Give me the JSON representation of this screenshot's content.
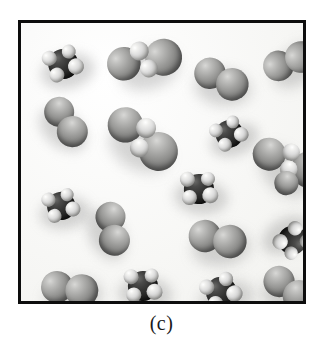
{
  "figure": {
    "caption": "(c)",
    "panel_border_color": "#0d0d0d",
    "panel_background_color": "#fbfbfa",
    "page_background_color": "#ffffff",
    "rendering_style": "space-filling molecular models, grayscale photograph"
  },
  "legend_colors": {
    "large_gray_atom": "#8b8b89",
    "dark_carbon_atom": "#222221",
    "light_hydrogen_atom": "#dedede",
    "shadow": "#78787 6"
  },
  "chart_data": {
    "type": "scatter",
    "title": "(c)",
    "xlabel": "",
    "ylabel": "",
    "xlim": [
      0,
      288
    ],
    "ylim": [
      0,
      284
    ],
    "grid": false,
    "legend": "none",
    "counts": {
      "diatomic_molecules": 7,
      "methane_type_molecules": 6,
      "larger_polyatomic_molecules": 3,
      "total_molecules": 16
    },
    "molecules": [
      {
        "id": 1,
        "kind": "methane",
        "x": 42,
        "y": 40,
        "scale": 1.0,
        "rot": -12
      },
      {
        "id": 2,
        "kind": "poly4",
        "x": 122,
        "y": 38,
        "scale": 1.12,
        "rot": -18
      },
      {
        "id": 3,
        "kind": "diatomic",
        "x": 200,
        "y": 55,
        "scale": 1.05,
        "rot": 8
      },
      {
        "id": 4,
        "kind": "diatomic",
        "x": 268,
        "y": 38,
        "scale": 1.02,
        "rot": -40
      },
      {
        "id": 5,
        "kind": "diatomic",
        "x": 45,
        "y": 98,
        "scale": 1.0,
        "rot": 38
      },
      {
        "id": 6,
        "kind": "poly4",
        "x": 120,
        "y": 115,
        "scale": 1.18,
        "rot": 30
      },
      {
        "id": 7,
        "kind": "methane",
        "x": 208,
        "y": 110,
        "scale": 0.92,
        "rot": -20
      },
      {
        "id": 8,
        "kind": "poly5",
        "x": 268,
        "y": 140,
        "scale": 1.1,
        "rot": 48
      },
      {
        "id": 9,
        "kind": "methane",
        "x": 178,
        "y": 165,
        "scale": 1.0,
        "rot": 6
      },
      {
        "id": 10,
        "kind": "methane",
        "x": 40,
        "y": 182,
        "scale": 0.94,
        "rot": -8
      },
      {
        "id": 11,
        "kind": "diatomic",
        "x": 92,
        "y": 205,
        "scale": 1.0,
        "rot": 62
      },
      {
        "id": 12,
        "kind": "diatomic",
        "x": 196,
        "y": 215,
        "scale": 1.08,
        "rot": -6
      },
      {
        "id": 13,
        "kind": "methane",
        "x": 272,
        "y": 218,
        "scale": 0.96,
        "rot": 150
      },
      {
        "id": 14,
        "kind": "diatomic",
        "x": 48,
        "y": 265,
        "scale": 1.06,
        "rot": -10
      },
      {
        "id": 15,
        "kind": "methane",
        "x": 122,
        "y": 262,
        "scale": 1.0,
        "rot": 4
      },
      {
        "id": 16,
        "kind": "methane",
        "x": 200,
        "y": 268,
        "scale": 1.02,
        "rot": -16
      },
      {
        "id": 17,
        "kind": "diatomic",
        "x": 268,
        "y": 265,
        "scale": 1.04,
        "rot": 18
      }
    ]
  }
}
